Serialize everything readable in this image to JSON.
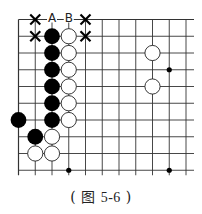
{
  "caption": {
    "open": "(",
    "label": "图",
    "number": "5-6",
    "close": ")"
  },
  "board": {
    "origin_x": 18.5,
    "origin_y": 19.5,
    "spacing": 16.75,
    "cols": 11,
    "rows": 10,
    "right_open": true,
    "bottom_line_row": 9,
    "line_color": "#333333",
    "black_color": "#000000",
    "white_fill": "#ffffff",
    "stones": [
      {
        "c": 2,
        "r": 1,
        "color": "black"
      },
      {
        "c": 3,
        "r": 1,
        "color": "white"
      },
      {
        "c": 2,
        "r": 2,
        "color": "black"
      },
      {
        "c": 3,
        "r": 2,
        "color": "white"
      },
      {
        "c": 2,
        "r": 3,
        "color": "black"
      },
      {
        "c": 3,
        "r": 3,
        "color": "white"
      },
      {
        "c": 2,
        "r": 4,
        "color": "black"
      },
      {
        "c": 3,
        "r": 4,
        "color": "white"
      },
      {
        "c": 2,
        "r": 5,
        "color": "black"
      },
      {
        "c": 3,
        "r": 5,
        "color": "white"
      },
      {
        "c": 0,
        "r": 6,
        "color": "black"
      },
      {
        "c": 2,
        "r": 6,
        "color": "black"
      },
      {
        "c": 3,
        "r": 6,
        "color": "white"
      },
      {
        "c": 1,
        "r": 7,
        "color": "black"
      },
      {
        "c": 2,
        "r": 7,
        "color": "white"
      },
      {
        "c": 1,
        "r": 8,
        "color": "white"
      },
      {
        "c": 2,
        "r": 8,
        "color": "white"
      },
      {
        "c": 8,
        "r": 2,
        "color": "white"
      },
      {
        "c": 8,
        "r": 4,
        "color": "white"
      }
    ],
    "star_points": [
      {
        "c": 9,
        "r": 3
      },
      {
        "c": 3,
        "r": 9
      },
      {
        "c": 9,
        "r": 9
      }
    ],
    "labels": [
      {
        "c": 2,
        "r": 0,
        "text": "A"
      },
      {
        "c": 3,
        "r": 0,
        "text": "B"
      }
    ],
    "crosses": [
      {
        "c": 1,
        "r": 0
      },
      {
        "c": 4,
        "r": 0
      },
      {
        "c": 1,
        "r": 1
      },
      {
        "c": 4,
        "r": 1
      }
    ]
  }
}
